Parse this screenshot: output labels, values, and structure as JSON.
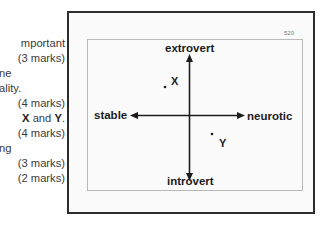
{
  "question_text": {
    "lines": [
      {
        "text": "mportant",
        "marks": ""
      },
      {
        "text": "",
        "marks": "(3 marks)"
      },
      {
        "text": "ne",
        "marks": ""
      },
      {
        "text": "ality.",
        "marks": ""
      },
      {
        "text": "",
        "marks": "(4 marks)"
      },
      {
        "text": "and",
        "marks": ""
      },
      {
        "text": "",
        "marks": "(4 marks)"
      },
      {
        "text": "ng",
        "marks": ""
      },
      {
        "text": "",
        "marks": "(3 marks)"
      },
      {
        "text": "",
        "marks": "(2 marks)"
      }
    ],
    "bold_x": "X",
    "bold_y": "Y",
    "and_word": "and"
  },
  "figure": {
    "slide_number": "520",
    "axes": {
      "top": "extrovert",
      "bottom": "introvert",
      "left": "stable",
      "right": "neurotic"
    },
    "points": [
      {
        "label": "X",
        "quadrant": "stable-extrovert"
      },
      {
        "label": "Y",
        "quadrant": "neurotic-introvert"
      }
    ],
    "colors": {
      "frame": "#2d2d2d",
      "inner_border": "#b9b9b9",
      "axis": "#1c1c1c",
      "text": "#3a3a3a"
    }
  }
}
